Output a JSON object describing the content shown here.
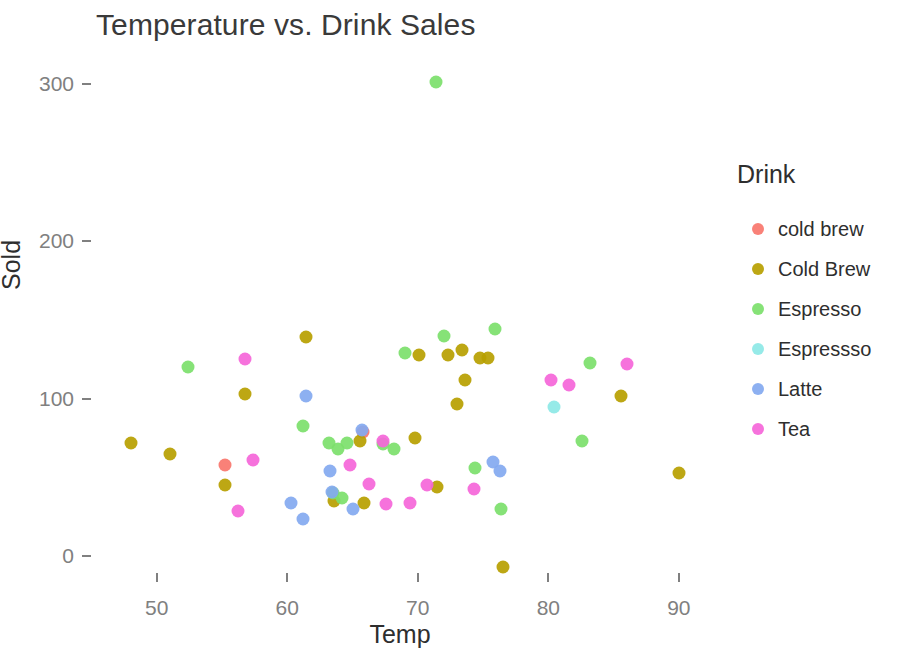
{
  "chart_data": {
    "type": "scatter",
    "title": "Temperature vs. Drink Sales",
    "xlabel": "Temp",
    "ylabel": "Sold",
    "xlim": [
      45.5,
      93
    ],
    "ylim": [
      -15,
      315
    ],
    "xticks": [
      50,
      60,
      70,
      80,
      90
    ],
    "yticks": [
      0,
      100,
      200,
      300
    ],
    "grid": false,
    "legend": {
      "title": "Drink",
      "position": "right",
      "entries": [
        {
          "name": "cold brew",
          "color": "#f8766d"
        },
        {
          "name": "Cold Brew",
          "color": "#b79f00"
        },
        {
          "name": "Espresso",
          "color": "#7cdf6b"
        },
        {
          "name": "Espressso",
          "color": "#8de8e6"
        },
        {
          "name": "Latte",
          "color": "#83a9f0"
        },
        {
          "name": "Tea",
          "color": "#f566d9"
        }
      ]
    },
    "series": [
      {
        "name": "cold brew",
        "color": "#f8766d",
        "points": [
          {
            "x": 55.2,
            "y": 58
          },
          {
            "x": 65.8,
            "y": 79
          }
        ]
      },
      {
        "name": "Cold Brew",
        "color": "#b79f00",
        "points": [
          {
            "x": 48.0,
            "y": 72
          },
          {
            "x": 51.0,
            "y": 65
          },
          {
            "x": 55.2,
            "y": 45
          },
          {
            "x": 56.8,
            "y": 103
          },
          {
            "x": 61.4,
            "y": 139
          },
          {
            "x": 63.6,
            "y": 35
          },
          {
            "x": 65.6,
            "y": 73
          },
          {
            "x": 65.9,
            "y": 34
          },
          {
            "x": 69.8,
            "y": 75
          },
          {
            "x": 70.1,
            "y": 128
          },
          {
            "x": 72.3,
            "y": 128
          },
          {
            "x": 73.4,
            "y": 131
          },
          {
            "x": 73.6,
            "y": 112
          },
          {
            "x": 73.0,
            "y": 97
          },
          {
            "x": 74.8,
            "y": 126
          },
          {
            "x": 75.4,
            "y": 126
          },
          {
            "x": 71.5,
            "y": 44
          },
          {
            "x": 76.5,
            "y": -7
          },
          {
            "x": 85.6,
            "y": 102
          },
          {
            "x": 90.0,
            "y": 53
          }
        ]
      },
      {
        "name": "Espresso",
        "color": "#7cdf6b",
        "points": [
          {
            "x": 52.4,
            "y": 120
          },
          {
            "x": 61.2,
            "y": 83
          },
          {
            "x": 63.2,
            "y": 72
          },
          {
            "x": 63.9,
            "y": 68
          },
          {
            "x": 64.6,
            "y": 72
          },
          {
            "x": 63.5,
            "y": 40
          },
          {
            "x": 64.2,
            "y": 37
          },
          {
            "x": 68.2,
            "y": 68
          },
          {
            "x": 69.0,
            "y": 129
          },
          {
            "x": 67.3,
            "y": 71
          },
          {
            "x": 71.4,
            "y": 301
          },
          {
            "x": 72.0,
            "y": 140
          },
          {
            "x": 74.4,
            "y": 56
          },
          {
            "x": 75.9,
            "y": 144
          },
          {
            "x": 76.4,
            "y": 30
          },
          {
            "x": 83.2,
            "y": 123
          },
          {
            "x": 82.6,
            "y": 73
          }
        ]
      },
      {
        "name": "Espressso",
        "color": "#8de8e6",
        "points": [
          {
            "x": 80.4,
            "y": 95
          }
        ]
      },
      {
        "name": "Latte",
        "color": "#83a9f0",
        "points": [
          {
            "x": 61.4,
            "y": 102
          },
          {
            "x": 60.3,
            "y": 34
          },
          {
            "x": 61.2,
            "y": 24
          },
          {
            "x": 63.3,
            "y": 54
          },
          {
            "x": 63.4,
            "y": 41
          },
          {
            "x": 65.0,
            "y": 30
          },
          {
            "x": 65.7,
            "y": 80
          },
          {
            "x": 75.8,
            "y": 60
          },
          {
            "x": 76.3,
            "y": 54
          }
        ]
      },
      {
        "name": "Tea",
        "color": "#f566d9",
        "points": [
          {
            "x": 56.8,
            "y": 125
          },
          {
            "x": 57.4,
            "y": 61
          },
          {
            "x": 56.2,
            "y": 29
          },
          {
            "x": 64.8,
            "y": 58
          },
          {
            "x": 66.3,
            "y": 46
          },
          {
            "x": 67.3,
            "y": 73
          },
          {
            "x": 67.6,
            "y": 33
          },
          {
            "x": 69.4,
            "y": 34
          },
          {
            "x": 70.7,
            "y": 45
          },
          {
            "x": 74.3,
            "y": 43
          },
          {
            "x": 80.2,
            "y": 112
          },
          {
            "x": 81.6,
            "y": 109
          },
          {
            "x": 86.0,
            "y": 122
          }
        ]
      }
    ]
  }
}
